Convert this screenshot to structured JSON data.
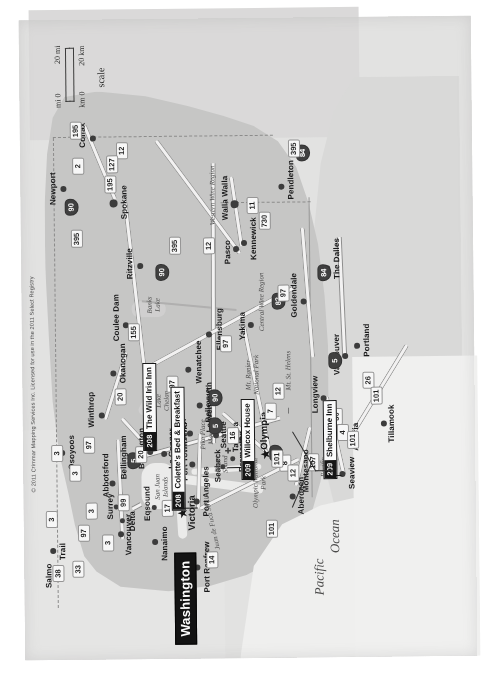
{
  "map": {
    "title": "Washington",
    "copyright": "© 2011 Crimmar Mapping Services Inc. Licensed for use in the 2011 Select Registry",
    "state_capital_marker": "star",
    "colors": {
      "state_fill": "#c9c8c3",
      "neighbor_fill": "#dedcd7",
      "ocean": "#f3f2ef",
      "road": "#f6f5f2",
      "label_text": "#16161a",
      "callout_bg": "#131313",
      "callout_text": "#ffffff"
    }
  },
  "scale": {
    "label": "scale",
    "mi_zero": "mi 0",
    "mi_max": "20 mi",
    "km_zero": "km 0",
    "km_max": "20 km"
  },
  "water_labels": [
    {
      "text": "Pacific",
      "style": "ocean"
    },
    {
      "text": "Ocean",
      "style": "ocean"
    },
    {
      "text": "Juan de Fuca Strait",
      "style": "strait"
    },
    {
      "text": "Puget\nSound",
      "style": "region"
    }
  ],
  "region_labels": [
    {
      "text": "Western Wine Region"
    },
    {
      "text": "Central Wine Region"
    },
    {
      "text": "Olympic National\nPark"
    },
    {
      "text": "Mt. Ranier\nNational Park"
    },
    {
      "text": "Pacific\nBeaches"
    },
    {
      "text": "San Juan\nIslands"
    },
    {
      "text": "Lake\nChelan"
    },
    {
      "text": "Banks\nLake"
    },
    {
      "text": "Mt. St. Helens"
    },
    {
      "text": "Pike Place\nMarket"
    }
  ],
  "cities": [
    {
      "name": "Newport",
      "x": 470,
      "y": 42,
      "size": "md"
    },
    {
      "name": "Spokane",
      "x": 455,
      "y": 92,
      "size": "md"
    },
    {
      "name": "Colfax",
      "x": 520,
      "y": 72,
      "size": "md"
    },
    {
      "name": "Ritzville",
      "x": 392,
      "y": 118,
      "size": "md"
    },
    {
      "name": "Coulee Dam",
      "x": 333,
      "y": 103,
      "size": "md"
    },
    {
      "name": "Okanogan",
      "x": 285,
      "y": 90,
      "size": "md"
    },
    {
      "name": "Winthrop",
      "x": 243,
      "y": 78,
      "size": "md"
    },
    {
      "name": "Osoyoos",
      "x": 206,
      "y": 38,
      "size": "md"
    },
    {
      "name": "Trail",
      "x": 108,
      "y": 28,
      "size": "md"
    },
    {
      "name": "Salmo",
      "x": 84,
      "y": 33,
      "size": "md"
    },
    {
      "name": "Wenatchee",
      "x": 288,
      "y": 165,
      "size": "md"
    },
    {
      "name": "Leavenworth",
      "x": 252,
      "y": 176,
      "size": "md"
    },
    {
      "name": "Ellensburg",
      "x": 323,
      "y": 186,
      "size": "md"
    },
    {
      "name": "Yakima",
      "x": 332,
      "y": 228,
      "size": "md"
    },
    {
      "name": "Pasco",
      "x": 408,
      "y": 214,
      "size": "md"
    },
    {
      "name": "Kennewick",
      "x": 414,
      "y": 222,
      "size": "md"
    },
    {
      "name": "Walla Walla",
      "x": 452,
      "y": 212,
      "size": "md"
    },
    {
      "name": "Pendleton",
      "x": 470,
      "y": 260,
      "size": "md"
    },
    {
      "name": "Goldendale",
      "x": 355,
      "y": 281,
      "size": "md"
    },
    {
      "name": "The Dalles",
      "x": 388,
      "y": 305,
      "size": "md"
    },
    {
      "name": "Vancouver",
      "x": 300,
      "y": 322,
      "size": "md"
    },
    {
      "name": "Portland",
      "x": 310,
      "y": 334,
      "size": "md"
    },
    {
      "name": "Tillamook",
      "x": 232,
      "y": 360,
      "size": "md"
    },
    {
      "name": "Astoria",
      "x": 218,
      "y": 322,
      "size": "md"
    },
    {
      "name": "Longview",
      "x": 258,
      "y": 300,
      "size": "md"
    },
    {
      "name": "Seaview",
      "x": 182,
      "y": 318,
      "size": "md"
    },
    {
      "name": "Montesano",
      "x": 178,
      "y": 272,
      "size": "md"
    },
    {
      "name": "Aberdeen",
      "x": 160,
      "y": 268,
      "size": "md"
    },
    {
      "name": "Olympia",
      "x": 205,
      "y": 242,
      "size": "capital"
    },
    {
      "name": "Tacoma",
      "x": 218,
      "y": 218,
      "size": "md"
    },
    {
      "name": "Seattle",
      "x": 222,
      "y": 192,
      "size": "md"
    },
    {
      "name": "Bellevue",
      "x": 232,
      "y": 188,
      "size": "md"
    },
    {
      "name": "Everett",
      "x": 224,
      "y": 166,
      "size": "md"
    },
    {
      "name": "Bremerton",
      "x": 198,
      "y": 208,
      "size": "md"
    },
    {
      "name": "Seabeck",
      "x": 190,
      "y": 198,
      "size": "md"
    },
    {
      "name": "Port Townsend",
      "x": 193,
      "y": 168,
      "size": "md"
    },
    {
      "name": "Port Angeles",
      "x": 156,
      "y": 172,
      "size": "md"
    },
    {
      "name": "La Conner",
      "x": 204,
      "y": 140,
      "size": "md"
    },
    {
      "name": "Burlington",
      "x": 206,
      "y": 126,
      "size": "md"
    },
    {
      "name": "Bellingham",
      "x": 196,
      "y": 107,
      "size": "md"
    },
    {
      "name": "Abbotsford",
      "x": 175,
      "y": 88,
      "size": "md"
    },
    {
      "name": "Surrey",
      "x": 152,
      "y": 92,
      "size": "md"
    },
    {
      "name": "Delta",
      "x": 138,
      "y": 98,
      "size": "md"
    },
    {
      "name": "Vancouver",
      "x": 124,
      "y": 96,
      "size": "md"
    },
    {
      "name": "Nanaimo",
      "x": 116,
      "y": 130,
      "size": "md"
    },
    {
      "name": "Victoria",
      "x": 146,
      "y": 158,
      "size": "capital"
    },
    {
      "name": "Eqsound",
      "x": 150,
      "y": 130,
      "size": "md"
    },
    {
      "name": "Port Renfrew",
      "x": 90,
      "y": 172,
      "size": "md"
    }
  ],
  "highway_shields": [
    {
      "label": "2",
      "type": "us"
    },
    {
      "label": "3",
      "type": "ca"
    },
    {
      "label": "3",
      "type": "ca"
    },
    {
      "label": "3",
      "type": "ca"
    },
    {
      "label": "3",
      "type": "ca"
    },
    {
      "label": "3",
      "type": "ca"
    },
    {
      "label": "4",
      "type": "state"
    },
    {
      "label": "5",
      "type": "interstate"
    },
    {
      "label": "5",
      "type": "interstate"
    },
    {
      "label": "5",
      "type": "interstate"
    },
    {
      "label": "5",
      "type": "interstate"
    },
    {
      "label": "7",
      "type": "state"
    },
    {
      "label": "8",
      "type": "us"
    },
    {
      "label": "11",
      "type": "us"
    },
    {
      "label": "12",
      "type": "us"
    },
    {
      "label": "12",
      "type": "us"
    },
    {
      "label": "12",
      "type": "us"
    },
    {
      "label": "12",
      "type": "us"
    },
    {
      "label": "14",
      "type": "ca"
    },
    {
      "label": "16",
      "type": "state"
    },
    {
      "label": "17",
      "type": "ca"
    },
    {
      "label": "20",
      "type": "state"
    },
    {
      "label": "20",
      "type": "state"
    },
    {
      "label": "26",
      "type": "us"
    },
    {
      "label": "30",
      "type": "us"
    },
    {
      "label": "33",
      "type": "ca"
    },
    {
      "label": "38",
      "type": "ca"
    },
    {
      "label": "82",
      "type": "interstate"
    },
    {
      "label": "84",
      "type": "interstate"
    },
    {
      "label": "84",
      "type": "interstate"
    },
    {
      "label": "90",
      "type": "interstate"
    },
    {
      "label": "90",
      "type": "interstate"
    },
    {
      "label": "90",
      "type": "interstate"
    },
    {
      "label": "97",
      "type": "us"
    },
    {
      "label": "97",
      "type": "us"
    },
    {
      "label": "97",
      "type": "us"
    },
    {
      "label": "97",
      "type": "us"
    },
    {
      "label": "97",
      "type": "us"
    },
    {
      "label": "99",
      "type": "ca"
    },
    {
      "label": "101",
      "type": "us"
    },
    {
      "label": "101",
      "type": "us"
    },
    {
      "label": "101",
      "type": "us"
    },
    {
      "label": "101",
      "type": "us"
    },
    {
      "label": "101",
      "type": "us"
    },
    {
      "label": "107",
      "type": "state"
    },
    {
      "label": "127",
      "type": "state"
    },
    {
      "label": "155",
      "type": "state"
    },
    {
      "label": "195",
      "type": "us"
    },
    {
      "label": "195",
      "type": "us"
    },
    {
      "label": "395",
      "type": "us"
    },
    {
      "label": "395",
      "type": "us"
    },
    {
      "label": "395",
      "type": "us"
    },
    {
      "label": "730",
      "type": "state"
    }
  ],
  "inns": [
    {
      "num": "208",
      "name": "The Wild Iris Inn"
    },
    {
      "num": "208",
      "name": "Colette's Bed & Breakfast"
    },
    {
      "num": "209",
      "name": "Willcox House"
    },
    {
      "num": "209",
      "name": "Shelburne Inn"
    }
  ]
}
